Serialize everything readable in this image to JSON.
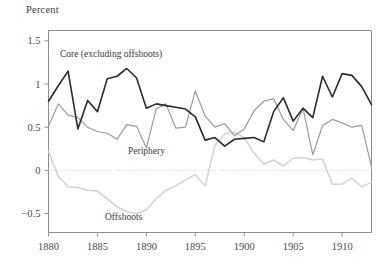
{
  "axis_title": "Percent",
  "labels": {
    "core": "Core (excluding offshoots)",
    "periphery": "Periphery",
    "offshoots": "Offshoots"
  },
  "colors": {
    "core": "#2b2b2b",
    "periphery": "#9a9a9a",
    "offshoots": "#d2d2d2",
    "axis": "#8d8d8d",
    "zero_line": "#cfcfcf",
    "text": "#4a4a4a"
  },
  "chart_data": {
    "type": "line",
    "title": "",
    "subtitle": "",
    "xlabel": "",
    "ylabel": "Percent",
    "xlim": [
      1880,
      1913
    ],
    "ylim": [
      -0.72,
      1.62
    ],
    "grid": false,
    "legend": "inline-annotations",
    "xticks": [
      1880,
      1885,
      1890,
      1895,
      1900,
      1905,
      1910
    ],
    "yticks": [
      -0.5,
      0,
      0.5,
      1,
      1.5
    ],
    "ytick_labels": [
      "−0.5",
      "0",
      "0.5",
      "1",
      "1.5"
    ],
    "zero_line": 0,
    "x": [
      1880,
      1881,
      1882,
      1883,
      1884,
      1885,
      1886,
      1887,
      1888,
      1889,
      1890,
      1891,
      1892,
      1893,
      1894,
      1895,
      1896,
      1897,
      1898,
      1899,
      1900,
      1901,
      1902,
      1903,
      1904,
      1905,
      1906,
      1907,
      1908,
      1909,
      1910,
      1911,
      1912,
      1913
    ],
    "series": [
      {
        "name": "Core (excluding offshoots)",
        "color": "#2b2b2b",
        "values": [
          0.8,
          0.98,
          1.15,
          0.48,
          0.81,
          0.68,
          1.06,
          1.09,
          1.18,
          1.07,
          0.72,
          0.77,
          0.75,
          0.73,
          0.71,
          0.62,
          0.35,
          0.38,
          0.28,
          0.36,
          0.37,
          0.38,
          0.33,
          0.68,
          0.84,
          0.57,
          0.72,
          0.61,
          1.09,
          0.85,
          1.12,
          1.1,
          0.97,
          0.76
        ]
      },
      {
        "name": "Periphery",
        "color": "#9a9a9a",
        "values": [
          0.51,
          0.77,
          0.64,
          0.61,
          0.5,
          0.45,
          0.43,
          0.36,
          0.53,
          0.51,
          0.26,
          0.71,
          0.77,
          0.49,
          0.5,
          0.92,
          0.63,
          0.5,
          0.54,
          0.4,
          0.48,
          0.69,
          0.8,
          0.83,
          0.59,
          0.46,
          0.72,
          0.18,
          0.52,
          0.59,
          0.55,
          0.5,
          0.52,
          0.04
        ]
      },
      {
        "name": "Offshoots",
        "color": "#d2d2d2",
        "values": [
          0.22,
          -0.07,
          -0.19,
          -0.2,
          -0.23,
          -0.24,
          -0.33,
          -0.42,
          -0.48,
          -0.5,
          -0.46,
          -0.33,
          -0.23,
          -0.18,
          -0.11,
          -0.05,
          -0.18,
          0.29,
          0.42,
          0.44,
          0.38,
          0.2,
          0.07,
          0.12,
          0.05,
          0.14,
          0.15,
          0.12,
          0.13,
          -0.16,
          -0.16,
          -0.09,
          -0.19,
          -0.14
        ]
      }
    ]
  }
}
